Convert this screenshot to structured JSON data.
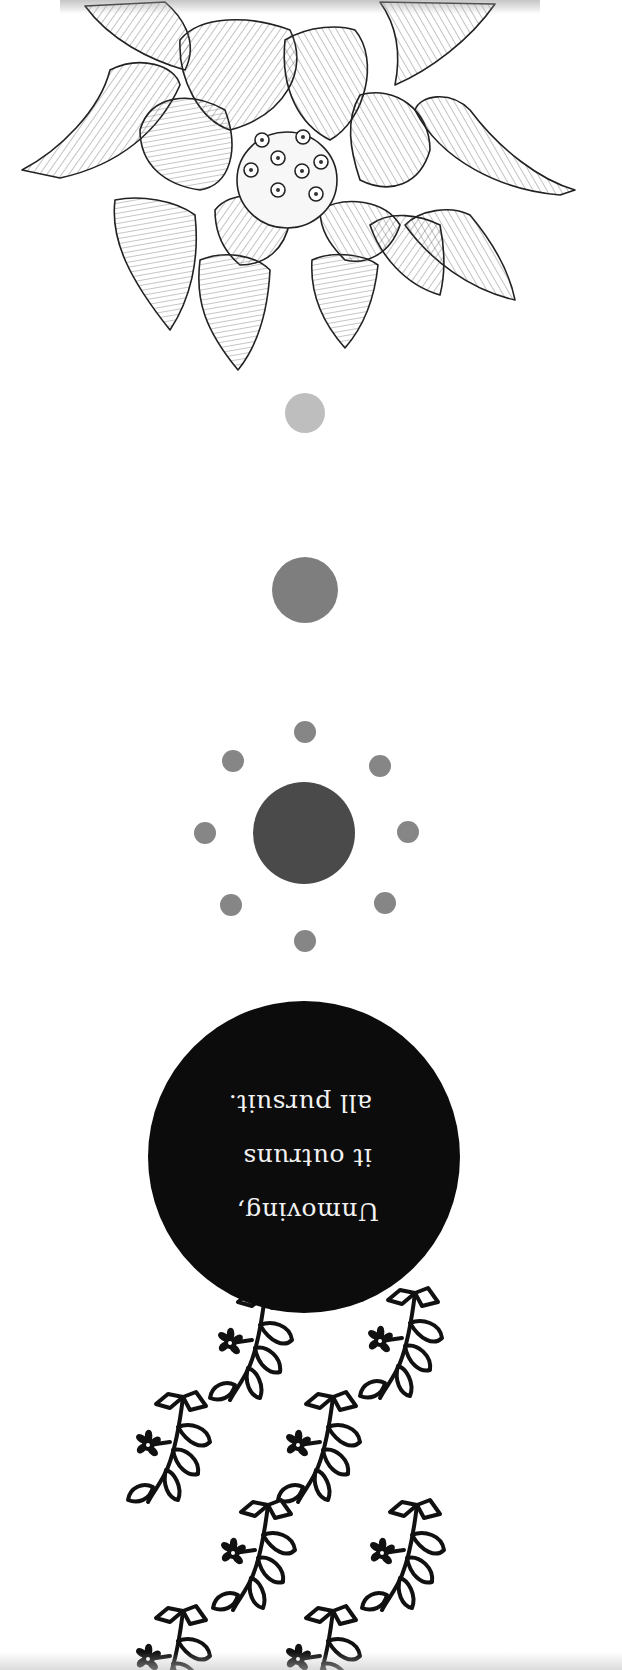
{
  "artwork": {
    "orientation": "rotated-180",
    "background": "#ffffff",
    "lotus": {
      "name": "lotus-flower-sketch",
      "stroke": "#2a2a2a",
      "seed_count": 8
    },
    "dots": {
      "small": {
        "cx": 305,
        "cy": 413,
        "r": 20,
        "color": "#bebebe"
      },
      "medium": {
        "cx": 305,
        "cy": 590,
        "r": 33,
        "color": "#7e7e7e"
      },
      "sun_core": {
        "cx": 304,
        "cy": 833,
        "r": 51,
        "color": "#4a4a4a"
      },
      "sun_rays": {
        "r": 11,
        "color": "#868686",
        "positions": [
          [
            305,
            732
          ],
          [
            380,
            766
          ],
          [
            408,
            832
          ],
          [
            385,
            903
          ],
          [
            305,
            941
          ],
          [
            231,
            905
          ],
          [
            205,
            833
          ],
          [
            233,
            761
          ]
        ]
      }
    },
    "quote_disc": {
      "cx": 304,
      "cy": 1157,
      "r": 156,
      "color": "#0c0c0c",
      "text_color": "#f2f2f2"
    },
    "quote": {
      "lines": [
        "Unmoving,",
        "it outruns",
        "all pursuit."
      ]
    },
    "sprigs": {
      "color": "#111111",
      "positions": [
        [
          210,
          1290
        ],
        [
          360,
          1288
        ],
        [
          128,
          1392
        ],
        [
          278,
          1392
        ],
        [
          213,
          1500
        ],
        [
          362,
          1500
        ],
        [
          128,
          1606
        ],
        [
          278,
          1606
        ]
      ]
    }
  }
}
